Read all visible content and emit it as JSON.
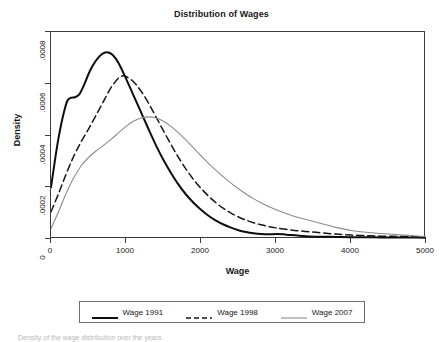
{
  "chart_data": {
    "type": "line",
    "title": "Distribution of Wages",
    "xlabel": "Wage",
    "ylabel": "Density",
    "xlim": [
      0,
      5000
    ],
    "ylim": [
      0,
      0.0008
    ],
    "grid": false,
    "legend_position": "bottom",
    "xticks": [
      "0",
      "1000",
      "2000",
      "3000",
      "4000",
      "5000"
    ],
    "xtick_values": [
      0,
      1000,
      2000,
      3000,
      4000,
      5000
    ],
    "yticks": [
      "0",
      ".0002",
      ".0004",
      ".0006",
      ".0008"
    ],
    "ytick_values": [
      0,
      0.0002,
      0.0004,
      0.0006,
      0.0008
    ],
    "series": [
      {
        "name": "Wage 1991",
        "style": "solid",
        "color": "#0d0d0d",
        "width": 2.0,
        "peak_x": 750,
        "peak_y": 0.00072,
        "x": [
          0,
          100,
          200,
          260,
          320,
          380,
          440,
          520,
          600,
          680,
          750,
          820,
          900,
          1000,
          1100,
          1200,
          1300,
          1400,
          1500,
          1600,
          1700,
          1800,
          1900,
          2000,
          2100,
          2200,
          2300,
          2400,
          2500,
          2600,
          2700,
          2800,
          2900,
          3000,
          3100,
          3200,
          3400,
          3600,
          3800,
          4000,
          4200,
          4400,
          4600,
          4800,
          5000
        ],
        "y": [
          0.0002,
          0.00039,
          0.00052,
          0.000545,
          0.000548,
          0.00056,
          0.000595,
          0.00065,
          0.00069,
          0.000715,
          0.000722,
          0.000712,
          0.00068,
          0.00062,
          0.000555,
          0.00049,
          0.000425,
          0.000362,
          0.000305,
          0.000255,
          0.00021,
          0.000172,
          0.00014,
          0.000113,
          9e-05,
          7.1e-05,
          5.6e-05,
          4.4e-05,
          3.4e-05,
          2.7e-05,
          2.2e-05,
          1.9e-05,
          1.8e-05,
          1.9e-05,
          1.8e-05,
          1.5e-05,
          1.1e-05,
          9e-06,
          8e-06,
          7e-06,
          7e-06,
          6e-06,
          6e-06,
          6e-06,
          5e-06
        ]
      },
      {
        "name": "Wage 1998",
        "style": "dashed",
        "color": "#161616",
        "width": 1.5,
        "peak_x": 950,
        "peak_y": 0.00063,
        "x": [
          0,
          100,
          200,
          300,
          400,
          500,
          600,
          700,
          800,
          900,
          950,
          1000,
          1100,
          1200,
          1300,
          1400,
          1500,
          1600,
          1700,
          1800,
          1900,
          2000,
          2100,
          2200,
          2300,
          2400,
          2500,
          2600,
          2700,
          2800,
          2900,
          3000,
          3200,
          3400,
          3600,
          3800,
          4000,
          4200,
          4400,
          4600,
          4800,
          5000
        ],
        "y": [
          0.000105,
          0.000175,
          0.00025,
          0.000318,
          0.000375,
          0.000425,
          0.000478,
          0.000532,
          0.000585,
          0.000622,
          0.00063,
          0.000628,
          0.000608,
          0.000572,
          0.000525,
          0.000472,
          0.000418,
          0.000365,
          0.000315,
          0.00027,
          0.00023,
          0.000196,
          0.000166,
          0.00014,
          0.000118,
          0.0001,
          8.5e-05,
          7.3e-05,
          6.3e-05,
          5.5e-05,
          4.8e-05,
          4.3e-05,
          3.5e-05,
          2.9e-05,
          2.4e-05,
          1.9e-05,
          1.5e-05,
          1.3e-05,
          1.1e-05,
          1e-05,
          9e-06,
          8e-06
        ]
      },
      {
        "name": "Wage 2007",
        "style": "solid",
        "color": "#8c8c8c",
        "width": 1.1,
        "peak_x": 1300,
        "peak_y": 0.00047,
        "x": [
          0,
          100,
          200,
          300,
          400,
          500,
          600,
          700,
          800,
          900,
          1000,
          1100,
          1200,
          1300,
          1400,
          1500,
          1600,
          1700,
          1800,
          1900,
          2000,
          2100,
          2200,
          2300,
          2400,
          2500,
          2600,
          2700,
          2800,
          2900,
          3000,
          3200,
          3400,
          3600,
          3800,
          4000,
          4200,
          4400,
          4600,
          4800,
          5000
        ],
        "y": [
          4e-05,
          0.000105,
          0.000175,
          0.000235,
          0.000282,
          0.000315,
          0.00034,
          0.000362,
          0.000385,
          0.00041,
          0.000435,
          0.000455,
          0.000468,
          0.000472,
          0.000468,
          0.000455,
          0.000435,
          0.00041,
          0.000382,
          0.000352,
          0.000322,
          0.000292,
          0.000265,
          0.00024,
          0.000216,
          0.000194,
          0.000174,
          0.000156,
          0.00014,
          0.000126,
          0.000113,
          9.2e-05,
          7.5e-05,
          6e-05,
          4.5e-05,
          3.3e-05,
          2.6e-05,
          2.1e-05,
          1.7e-05,
          1.3e-05,
          9e-06
        ]
      }
    ]
  },
  "legend": {
    "items": [
      {
        "label": "Wage 1991"
      },
      {
        "label": "Wage 1998"
      },
      {
        "label": "Wage 2007"
      }
    ]
  },
  "caption": {
    "text": "Density of the wage distribution over the years"
  }
}
